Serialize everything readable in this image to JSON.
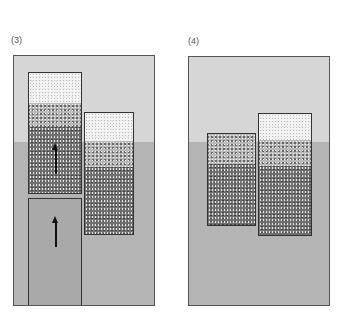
{
  "panels": [
    {
      "label": "(3)",
      "description": "Two cylinders partly submerged; left cylinder pushed up by a piston"
    },
    {
      "label": "(4)",
      "description": "Two cylinders floating at different levels"
    }
  ],
  "colors": {
    "air": "#d6d6d6",
    "water": "#b4b4b4",
    "piston": "#a9a9a9",
    "outline": "#333333"
  },
  "annotations": {
    "arrow_upper": "up-arrow",
    "arrow_piston": "up-arrow"
  }
}
